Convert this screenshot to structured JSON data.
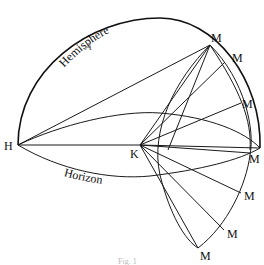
{
  "diagram": {
    "labels": {
      "hemisphere": "Hemisphere",
      "horizon": "Horizon",
      "region": "A",
      "h_point": "H",
      "k_point": "K",
      "m_points": [
        "M",
        "M",
        "M",
        "M",
        "M",
        "M",
        "M"
      ]
    },
    "caption": "Fig. 1"
  }
}
